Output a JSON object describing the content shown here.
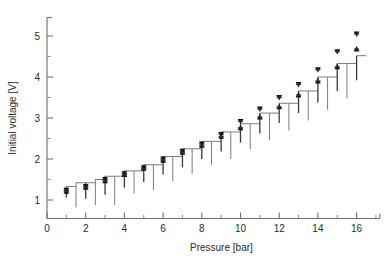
{
  "chart_data": {
    "type": "scatter",
    "title": "",
    "xlabel": "Pressure [bar]",
    "ylabel": "Initial voltage [V]",
    "xlim": [
      0,
      17.2
    ],
    "ylim": [
      0.55,
      5.45
    ],
    "xticks": [
      0,
      2,
      4,
      6,
      8,
      10,
      12,
      14,
      16
    ],
    "xticklabels": [
      "0",
      "2",
      "4",
      "6",
      "8",
      "10",
      "12",
      "14",
      "16"
    ],
    "xminorticks": [
      1,
      3,
      5,
      7,
      9,
      11,
      13,
      15,
      17
    ],
    "yticks": [
      1,
      2,
      3,
      4,
      5
    ],
    "yticklabels": [
      "1",
      "2",
      "3",
      "4",
      "5"
    ],
    "yminorticks": [
      1.5,
      2.5,
      3.5,
      4.5
    ],
    "grid": false,
    "legend": "none",
    "x": [
      1,
      2,
      3,
      4,
      5,
      6,
      7,
      8,
      9,
      10,
      11,
      12,
      13,
      14,
      15,
      16
    ],
    "series": [
      {
        "name": "down-triangle",
        "marker": "triangle-down",
        "color": "#111111",
        "values": [
          1.24,
          1.33,
          1.5,
          1.64,
          1.79,
          2.0,
          2.19,
          2.37,
          2.6,
          2.92,
          3.22,
          3.5,
          3.82,
          4.18,
          4.62,
          5.05
        ]
      },
      {
        "name": "up-triangle",
        "marker": "triangle-up",
        "color": "#111111",
        "values": [
          1.21,
          1.31,
          1.47,
          1.62,
          1.77,
          1.97,
          2.16,
          2.33,
          2.55,
          2.76,
          3.02,
          3.27,
          3.56,
          3.9,
          4.25,
          4.68
        ]
      }
    ],
    "errorbars": [
      {
        "x": 1.0,
        "low": 1.06,
        "high": 1.33
      },
      {
        "x": 1.5,
        "low": 0.82,
        "high": 1.42
      },
      {
        "x": 2.0,
        "low": 1.03,
        "high": 1.42
      },
      {
        "x": 2.5,
        "low": 0.88,
        "high": 1.5
      },
      {
        "x": 3.0,
        "low": 1.13,
        "high": 1.58
      },
      {
        "x": 3.5,
        "low": 0.88,
        "high": 1.58
      },
      {
        "x": 4.0,
        "low": 1.3,
        "high": 1.71
      },
      {
        "x": 4.5,
        "low": 1.16,
        "high": 1.71
      },
      {
        "x": 5.0,
        "low": 1.44,
        "high": 1.86
      },
      {
        "x": 5.5,
        "low": 1.24,
        "high": 1.86
      },
      {
        "x": 6.0,
        "low": 1.62,
        "high": 2.06
      },
      {
        "x": 6.5,
        "low": 1.46,
        "high": 2.06
      },
      {
        "x": 7.0,
        "low": 1.8,
        "high": 2.25
      },
      {
        "x": 7.5,
        "low": 1.64,
        "high": 2.25
      },
      {
        "x": 8.0,
        "low": 2.0,
        "high": 2.43
      },
      {
        "x": 8.5,
        "low": 1.86,
        "high": 2.43
      },
      {
        "x": 9.0,
        "low": 2.18,
        "high": 2.66
      },
      {
        "x": 9.5,
        "low": 2.0,
        "high": 2.66
      },
      {
        "x": 10.0,
        "low": 2.4,
        "high": 2.86
      },
      {
        "x": 10.5,
        "low": 2.24,
        "high": 2.86
      },
      {
        "x": 11.0,
        "low": 2.62,
        "high": 3.12
      },
      {
        "x": 11.5,
        "low": 2.46,
        "high": 3.12
      },
      {
        "x": 12.0,
        "low": 2.88,
        "high": 3.36
      },
      {
        "x": 12.5,
        "low": 2.7,
        "high": 3.36
      },
      {
        "x": 13.0,
        "low": 3.12,
        "high": 3.66
      },
      {
        "x": 13.5,
        "low": 2.94,
        "high": 3.66
      },
      {
        "x": 14.0,
        "low": 3.38,
        "high": 4.0
      },
      {
        "x": 14.5,
        "low": 3.2,
        "high": 4.0
      },
      {
        "x": 15.0,
        "low": 3.66,
        "high": 4.33
      },
      {
        "x": 15.5,
        "low": 3.48,
        "high": 4.33
      },
      {
        "x": 16.0,
        "low": 3.92,
        "high": 4.52
      }
    ]
  },
  "figure": {
    "xlabel": "Pressure [bar]",
    "ylabel": "Initial voltage [V]"
  }
}
